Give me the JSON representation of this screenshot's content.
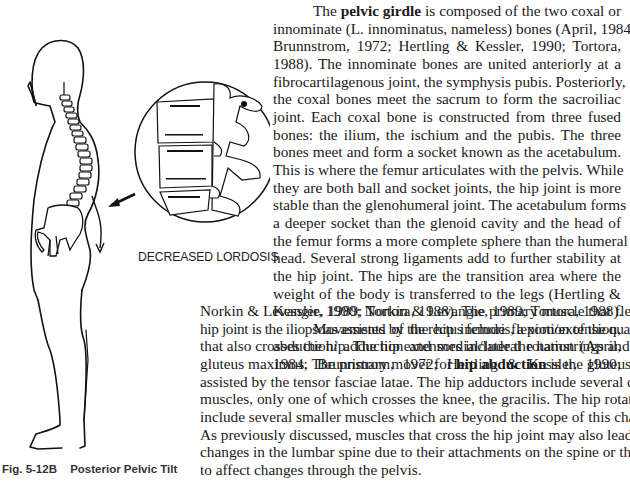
{
  "figure": {
    "inset_caption": "DECREASED LORDOSIS",
    "caption_number": "Fig. 5-12B",
    "caption_title": "Posterior Pelvic Tilt",
    "illustration": "standing-human-silhouette-with-spine-and-pelvis",
    "inset_illustration": "lumbar-vertebrae-magnified-circle",
    "arrow_icon": "arrow-pointing-left-down"
  },
  "paragraph1": {
    "l1_a": "The ",
    "l1_b": "pelvic girdle",
    "l1_c": " is composed of the two coxal or",
    "l2": "innominate (L. innominatus, nameless) bones (April, 1984;",
    "l3": "Brunnstrom, 1972; Hertling & Kessler, 1990; Tortora,",
    "l4": "1988). The innominate bones are united anteriorly at a",
    "l5": "fibrocartilagenous joint, the symphysis pubis. Posteriorly,",
    "l6": "the coxal bones meet the sacrum to form the sacroiliac",
    "l7": "joint. Each coxal bone is constructed from three fused",
    "l8": "bones: the ilium, the ischium and the pubis. The three",
    "l9": "bones meet and form a socket known as the acetabulum.",
    "l10": "This is where the femur articulates with the pelvis. While",
    "l11": "they are both ball and socket joints, the hip joint is more",
    "l12": "stable than the glenohumeral joint. The acetabulum forms",
    "l13": "a deeper socket than the glenoid cavity and the head of",
    "l14": "the femur forms a more complete sphere than the humeral",
    "l15": "head. Several strong ligaments add to further stability at",
    "l16": "the hip joint. The hips are the transition area where the",
    "l17": "weight of the body is transferred to the legs (Hertling &",
    "l18": "Kessler, 1990; Norkin & Levangie, 1989; Tortora, 1988)."
  },
  "paragraph2": {
    "l1": "Movements of the hip include flexion/extension,",
    "l2": "abduction/ adduction and medial/lateral rotation (April,",
    "l3": "1984; Brunnstrom, 1972; Hertling & Kessler, 1990;",
    "l4": "Norkin & Levangie, 1989; Tortora, 1988). The primary muscle that flexes the",
    "l5": "hip joint is the iliopsoas assisted by the rectus femoris, a portion of the quadriceps",
    "l6": "that also crosses the hip. The hip extensors include the hamstrings and the",
    "l7_a": "gluteus maximus. The primary mover for ",
    "l7_b": "hip abduction",
    "l7_c": " is the gluteus medius",
    "l8": "assisted by the tensor fasciae latae. The hip adductors include several different",
    "l9": "muscles, only one of which crosses the knee, the gracilis. The hip rotators",
    "l10": "include several smaller muscles which are beyond the scope of this chapter.",
    "l11": "As previously discussed, muscles that cross the hip joint may also lead to",
    "l12": "changes in the lumbar spine due to their attachments on the spine or their ability",
    "l13": "to affect changes through the pelvis."
  }
}
